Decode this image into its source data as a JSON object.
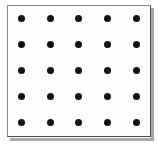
{
  "figure": {
    "name": "dot-grid-figure",
    "background_color": "#ffffff"
  },
  "frame": {
    "x": 7,
    "y": 5,
    "width": 144,
    "height": 132,
    "fill_color": "#fefefe",
    "border_color": "#4a4a4a",
    "border_width": 1,
    "shadow_color": "#a8a8a8"
  },
  "chart_data": {
    "type": "scatter",
    "title": "",
    "subtitle": "",
    "xlabel": "",
    "ylabel": "",
    "grid": false,
    "legend_position": "none",
    "rows": 5,
    "columns": 5,
    "point_count": 25,
    "marker": "filled-circle",
    "marker_color": "#111111",
    "marker_diameter": 7,
    "column_spacing": 28.75,
    "row_spacing": 26,
    "x": [
      21,
      50,
      78,
      107,
      136
    ],
    "y": [
      18,
      44,
      70,
      96,
      122
    ],
    "xlim": [
      7,
      151
    ],
    "ylim": [
      5,
      137
    ],
    "xticklabels": [],
    "yticklabels": [],
    "points": [
      {
        "x": 21,
        "y": 18
      },
      {
        "x": 50,
        "y": 18
      },
      {
        "x": 78,
        "y": 18
      },
      {
        "x": 107,
        "y": 18
      },
      {
        "x": 136,
        "y": 18
      },
      {
        "x": 21,
        "y": 44
      },
      {
        "x": 50,
        "y": 44
      },
      {
        "x": 78,
        "y": 44
      },
      {
        "x": 107,
        "y": 44
      },
      {
        "x": 136,
        "y": 44
      },
      {
        "x": 21,
        "y": 70
      },
      {
        "x": 50,
        "y": 70
      },
      {
        "x": 78,
        "y": 70
      },
      {
        "x": 107,
        "y": 70
      },
      {
        "x": 136,
        "y": 70
      },
      {
        "x": 21,
        "y": 96
      },
      {
        "x": 50,
        "y": 96
      },
      {
        "x": 78,
        "y": 96
      },
      {
        "x": 107,
        "y": 96
      },
      {
        "x": 136,
        "y": 96
      },
      {
        "x": 21,
        "y": 122
      },
      {
        "x": 50,
        "y": 122
      },
      {
        "x": 78,
        "y": 122
      },
      {
        "x": 107,
        "y": 122
      },
      {
        "x": 136,
        "y": 122
      }
    ]
  }
}
